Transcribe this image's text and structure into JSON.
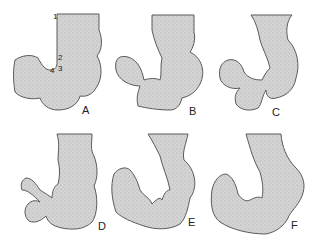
{
  "figure": {
    "fill_color": "#cfcfcf",
    "outline_color": "#5a5a5a",
    "panels": [
      {
        "label": "A",
        "markers": [
          "1",
          "2",
          "3",
          "4"
        ]
      },
      {
        "label": "B",
        "markers": []
      },
      {
        "label": "C",
        "markers": []
      },
      {
        "label": "D",
        "markers": []
      },
      {
        "label": "E",
        "markers": []
      },
      {
        "label": "F",
        "markers": []
      }
    ]
  }
}
